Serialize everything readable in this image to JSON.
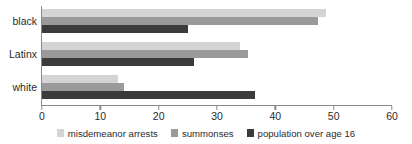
{
  "chart_data": {
    "type": "bar",
    "orientation": "horizontal",
    "title": "",
    "subtitle": "",
    "xlabel": "",
    "ylabel": "",
    "categories": [
      "black",
      "Latinx",
      "white"
    ],
    "series": [
      {
        "name": "misdemeanor arrests",
        "color": "#d4d4d4",
        "values": [
          48.7,
          34.0,
          13.0
        ]
      },
      {
        "name": "summonses",
        "color": "#9a9a9a",
        "values": [
          47.3,
          35.3,
          14.0
        ]
      },
      {
        "name": "population over age 16",
        "color": "#3b3b3b",
        "values": [
          25.0,
          26.0,
          36.5
        ]
      }
    ],
    "xlim": [
      0,
      60
    ],
    "xticks": [
      0,
      10,
      20,
      30,
      40,
      50,
      60
    ],
    "xtick_labels": [
      "0",
      "10",
      "20",
      "30",
      "40",
      "50",
      "60"
    ],
    "grid": false,
    "legend_position": "bottom"
  },
  "axes": {
    "spine_color": "#8a8a8a",
    "tick_label_color": "#2b2b2b",
    "category_label_color": "#2b2b2b"
  },
  "background": "#ffffff"
}
